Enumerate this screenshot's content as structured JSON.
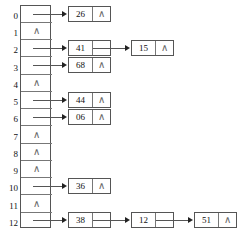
{
  "diagram": {
    "null_symbol": "∧",
    "table": {
      "slot_count": 13,
      "slots": [
        {
          "index": "0",
          "empty": false
        },
        {
          "index": "1",
          "empty": true
        },
        {
          "index": "2",
          "empty": false
        },
        {
          "index": "3",
          "empty": false
        },
        {
          "index": "4",
          "empty": true
        },
        {
          "index": "5",
          "empty": false
        },
        {
          "index": "6",
          "empty": false
        },
        {
          "index": "7",
          "empty": true
        },
        {
          "index": "8",
          "empty": true
        },
        {
          "index": "9",
          "empty": true
        },
        {
          "index": "10",
          "empty": false
        },
        {
          "index": "11",
          "empty": true
        },
        {
          "index": "12",
          "empty": false
        }
      ]
    },
    "chains": [
      {
        "slot": "0",
        "nodes": [
          {
            "value": "26",
            "next": null
          }
        ]
      },
      {
        "slot": "2",
        "nodes": [
          {
            "value": "41",
            "next": "15"
          },
          {
            "value": "15",
            "next": null
          }
        ]
      },
      {
        "slot": "3",
        "nodes": [
          {
            "value": "68",
            "next": null
          }
        ]
      },
      {
        "slot": "5",
        "nodes": [
          {
            "value": "44",
            "next": null
          }
        ]
      },
      {
        "slot": "6",
        "nodes": [
          {
            "value": "06",
            "next": null
          }
        ]
      },
      {
        "slot": "10",
        "nodes": [
          {
            "value": "36",
            "next": null
          }
        ]
      },
      {
        "slot": "12",
        "nodes": [
          {
            "value": "38",
            "next": "12"
          },
          {
            "value": "12",
            "next": "51"
          },
          {
            "value": "51",
            "next": null
          }
        ]
      }
    ],
    "colors": {
      "line": "#555555",
      "text": "#111111",
      "null_glyph": "#666666",
      "background": "#ffffff"
    }
  }
}
